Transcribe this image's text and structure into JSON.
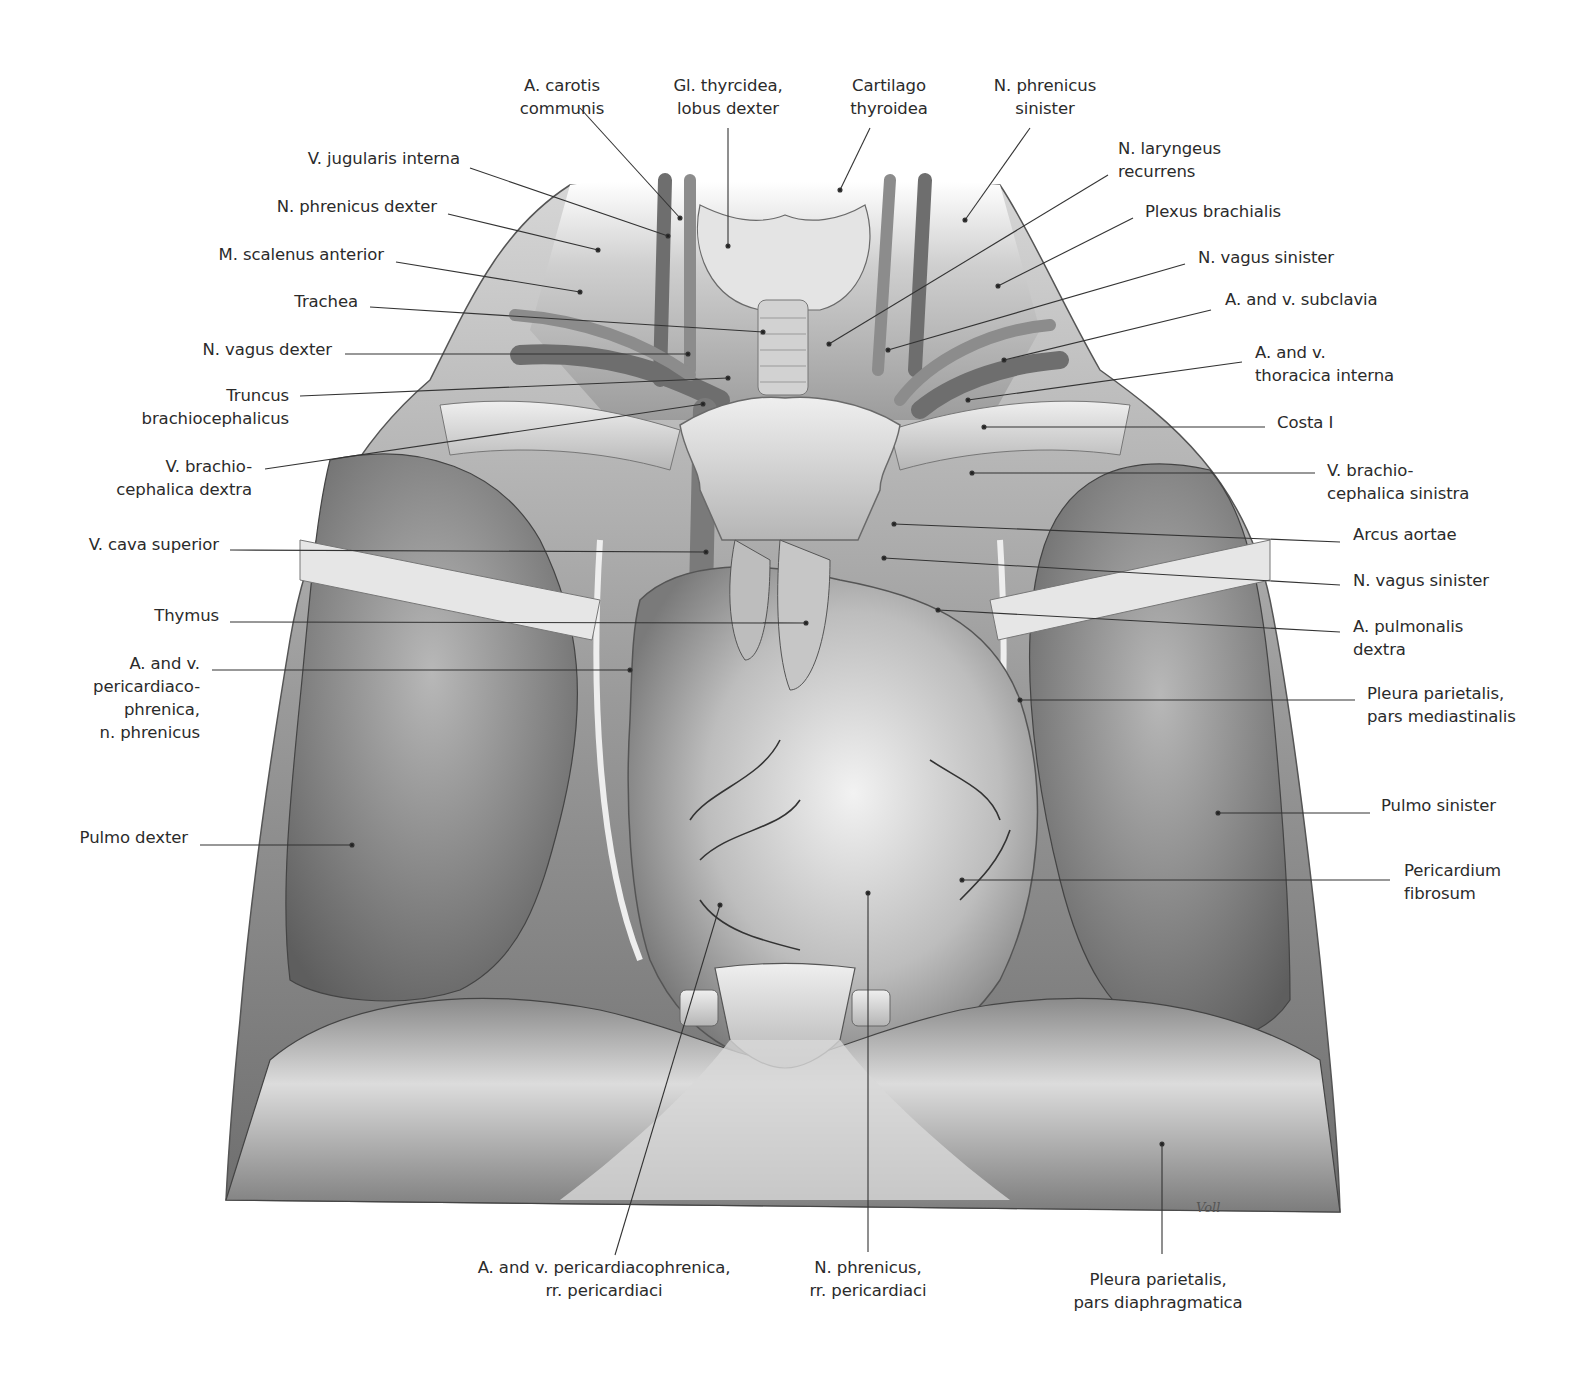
{
  "figure": {
    "type": "anatomical illustration",
    "signature": "Voll",
    "palette": {
      "background": "#ffffff",
      "label_text": "#2b2b2b",
      "leader_line": "#333333"
    }
  },
  "labels": {
    "top": [
      {
        "id": "a-carotis-communis",
        "text": "A. carotis\ncommunis",
        "x": 562,
        "y": 74,
        "align": "c",
        "line": [
          [
            580,
            108
          ],
          [
            680,
            218
          ]
        ]
      },
      {
        "id": "gl-thyroidea",
        "text": "Gl. thyrcidea,\nlobus dexter",
        "x": 728,
        "y": 74,
        "align": "c",
        "line": [
          [
            728,
            128
          ],
          [
            728,
            246
          ]
        ]
      },
      {
        "id": "cartilago-thyroidea",
        "text": "Cartilago\nthyroidea",
        "x": 889,
        "y": 74,
        "align": "c",
        "line": [
          [
            870,
            128
          ],
          [
            840,
            190
          ]
        ]
      },
      {
        "id": "n-phrenicus-sinister",
        "text": "N. phrenicus\nsinister",
        "x": 1045,
        "y": 74,
        "align": "c",
        "line": [
          [
            1030,
            128
          ],
          [
            965,
            220
          ]
        ]
      }
    ],
    "left": [
      {
        "id": "v-jugularis-interna",
        "text": "V. jugularis interna",
        "x": 460,
        "y": 147,
        "align": "r",
        "line": [
          [
            470,
            168
          ],
          [
            668,
            236
          ]
        ]
      },
      {
        "id": "n-phrenicus-dexter",
        "text": "N. phrenicus dexter",
        "x": 437,
        "y": 195,
        "align": "r",
        "line": [
          [
            448,
            214
          ],
          [
            598,
            250
          ]
        ]
      },
      {
        "id": "m-scalenus-anterior",
        "text": "M. scalenus anterior",
        "x": 384,
        "y": 243,
        "align": "r",
        "line": [
          [
            396,
            262
          ],
          [
            580,
            292
          ]
        ]
      },
      {
        "id": "trachea",
        "text": "Trachea",
        "x": 358,
        "y": 290,
        "align": "r",
        "line": [
          [
            370,
            307
          ],
          [
            763,
            332
          ]
        ]
      },
      {
        "id": "n-vagus-dexter",
        "text": "N. vagus dexter",
        "x": 332,
        "y": 338,
        "align": "r",
        "line": [
          [
            345,
            354
          ],
          [
            688,
            354
          ]
        ]
      },
      {
        "id": "truncus-brachiocephalicus",
        "text": "Truncus\nbrachiocephalicus",
        "x": 289,
        "y": 384,
        "align": "r",
        "line": [
          [
            300,
            396
          ],
          [
            728,
            378
          ]
        ]
      },
      {
        "id": "v-brachiocephalica-dextra",
        "text": "V. brachio-\ncephalica dextra",
        "x": 252,
        "y": 455,
        "align": "r",
        "line": [
          [
            265,
            469
          ],
          [
            703,
            404
          ]
        ]
      },
      {
        "id": "v-cava-superior",
        "text": "V. cava superior",
        "x": 219,
        "y": 533,
        "align": "r",
        "line": [
          [
            230,
            550
          ],
          [
            706,
            552
          ]
        ]
      },
      {
        "id": "thymus",
        "text": "Thymus",
        "x": 219,
        "y": 604,
        "align": "r",
        "line": [
          [
            230,
            622
          ],
          [
            806,
            623
          ]
        ]
      },
      {
        "id": "a-v-pericardiacophrenica",
        "text": "A. and v.\npericardiaco-\nphrenica,\nn. phrenicus",
        "x": 200,
        "y": 652,
        "align": "r",
        "line": [
          [
            212,
            670
          ],
          [
            630,
            670
          ]
        ]
      },
      {
        "id": "pulmo-dexter",
        "text": "Pulmo dexter",
        "x": 188,
        "y": 826,
        "align": "r",
        "line": [
          [
            200,
            845
          ],
          [
            352,
            845
          ]
        ]
      }
    ],
    "right": [
      {
        "id": "n-laryngeus-recurrens",
        "text": "N. laryngeus\nrecurrens",
        "x": 1118,
        "y": 137,
        "align": "l",
        "line": [
          [
            1108,
            175
          ],
          [
            829,
            344
          ]
        ]
      },
      {
        "id": "plexus-brachialis",
        "text": "Plexus brachialis",
        "x": 1145,
        "y": 200,
        "align": "l",
        "line": [
          [
            1133,
            218
          ],
          [
            998,
            286
          ]
        ]
      },
      {
        "id": "n-vagus-sinister-top",
        "text": "N. vagus sinister",
        "x": 1198,
        "y": 246,
        "align": "l",
        "line": [
          [
            1185,
            264
          ],
          [
            888,
            350
          ]
        ]
      },
      {
        "id": "a-v-subclavia",
        "text": "A. and v. subclavia",
        "x": 1225,
        "y": 288,
        "align": "l",
        "line": [
          [
            1211,
            310
          ],
          [
            1004,
            360
          ]
        ]
      },
      {
        "id": "a-v-thoracica-interna",
        "text": "A. and v.\nthoracica interna",
        "x": 1255,
        "y": 341,
        "align": "l",
        "line": [
          [
            1242,
            362
          ],
          [
            968,
            400
          ]
        ]
      },
      {
        "id": "costa-i",
        "text": "Costa I",
        "x": 1277,
        "y": 411,
        "align": "l",
        "line": [
          [
            1265,
            427
          ],
          [
            984,
            427
          ]
        ]
      },
      {
        "id": "v-brachiocephalica-sinistra",
        "text": "V. brachio-\ncephalica sinistra",
        "x": 1327,
        "y": 459,
        "align": "l",
        "line": [
          [
            1315,
            473
          ],
          [
            972,
            473
          ]
        ]
      },
      {
        "id": "arcus-aortae",
        "text": "Arcus aortae",
        "x": 1353,
        "y": 523,
        "align": "l",
        "line": [
          [
            1340,
            542
          ],
          [
            894,
            524
          ]
        ]
      },
      {
        "id": "n-vagus-sinister-mid",
        "text": "N. vagus sinister",
        "x": 1353,
        "y": 569,
        "align": "l",
        "line": [
          [
            1340,
            585
          ],
          [
            884,
            558
          ]
        ]
      },
      {
        "id": "a-pulmonalis-dextra",
        "text": "A. pulmonalis\ndextra",
        "x": 1353,
        "y": 615,
        "align": "l",
        "line": [
          [
            1340,
            632
          ],
          [
            938,
            610
          ]
        ]
      },
      {
        "id": "pleura-pars-mediastinalis",
        "text": "Pleura parietalis,\npars mediastinalis",
        "x": 1367,
        "y": 682,
        "align": "l",
        "line": [
          [
            1355,
            700
          ],
          [
            1020,
            700
          ]
        ]
      },
      {
        "id": "pulmo-sinister",
        "text": "Pulmo sinister",
        "x": 1381,
        "y": 794,
        "align": "l",
        "line": [
          [
            1370,
            813
          ],
          [
            1218,
            813
          ]
        ]
      },
      {
        "id": "pericardium-fibrosum",
        "text": "Pericardium\nfibrosum",
        "x": 1404,
        "y": 859,
        "align": "l",
        "line": [
          [
            1390,
            880
          ],
          [
            962,
            880
          ]
        ]
      }
    ],
    "bottom": [
      {
        "id": "a-v-pericardiacophrenica-rr",
        "text": "A. and v. pericardiacophrenica,\nrr. pericardiaci",
        "x": 604,
        "y": 1256,
        "align": "c",
        "line": [
          [
            615,
            1255
          ],
          [
            720,
            905
          ]
        ]
      },
      {
        "id": "n-phrenicus-rr",
        "text": "N. phrenicus,\nrr. pericardiaci",
        "x": 868,
        "y": 1256,
        "align": "c",
        "line": [
          [
            868,
            1252
          ],
          [
            868,
            893
          ]
        ]
      },
      {
        "id": "pleura-pars-diaphragmatica",
        "text": "Pleura parietalis,\npars diaphragmatica",
        "x": 1158,
        "y": 1268,
        "align": "c",
        "line": [
          [
            1162,
            1254
          ],
          [
            1162,
            1144
          ]
        ]
      }
    ]
  }
}
